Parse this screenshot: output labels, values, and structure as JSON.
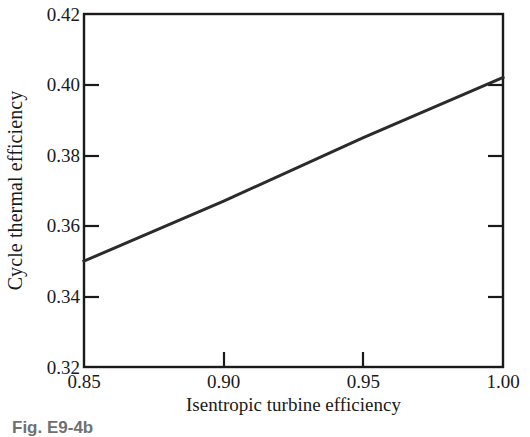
{
  "figure": {
    "caption": "Fig. E9-4b",
    "background_color": "#ffffff",
    "line_color": "#2b2b2b",
    "axis_color": "#1a1a1a"
  },
  "chart_data": {
    "type": "line",
    "title": "",
    "xlabel": "Isentropic turbine efficiency",
    "ylabel": "Cycle thermal efficiency",
    "xlim": [
      0.85,
      1.0
    ],
    "ylim": [
      0.32,
      0.42
    ],
    "xticks": [
      0.85,
      0.9,
      0.95,
      1.0
    ],
    "yticks": [
      0.32,
      0.34,
      0.36,
      0.38,
      0.4,
      0.42
    ],
    "xtick_labels": [
      "0.85",
      "0.90",
      "0.95",
      "1.00"
    ],
    "ytick_labels": [
      "0.32",
      "0.34",
      "0.36",
      "0.38",
      "0.40",
      "0.42"
    ],
    "grid": false,
    "legend": null,
    "series": [
      {
        "name": "Cycle thermal efficiency",
        "x": [
          0.85,
          0.9,
          0.95,
          1.0
        ],
        "values": [
          0.35,
          0.367,
          0.385,
          0.402
        ],
        "line_width": 3,
        "color": "#2b2b2b"
      }
    ],
    "annotations": []
  }
}
